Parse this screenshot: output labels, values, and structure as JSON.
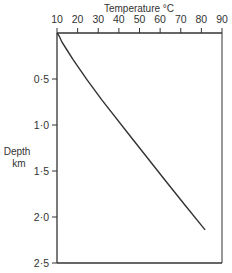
{
  "chart_data": {
    "type": "line",
    "title": "",
    "xlabel": "Temperature °C",
    "ylabel": "Depth km",
    "ylabel_lines": [
      "Depth",
      "km"
    ],
    "x_axis_position": "top",
    "y_axis_inverted": true,
    "xlim": [
      10,
      90
    ],
    "ylim": [
      0,
      2.5
    ],
    "x_ticks": [
      10,
      20,
      30,
      40,
      50,
      60,
      70,
      80,
      90
    ],
    "x_tick_labels": [
      "10",
      "20",
      "30",
      "40",
      "50",
      "60",
      "70",
      "80",
      "90"
    ],
    "y_ticks": [
      0.5,
      1.0,
      1.5,
      2.0,
      2.5
    ],
    "y_tick_labels": [
      "0·5",
      "1·0",
      "1·5",
      "2·0",
      "2·5"
    ],
    "grid": false,
    "legend": null,
    "series": [
      {
        "name": "Temperature vs depth",
        "points": [
          {
            "x": 10.0,
            "y": 0.0
          },
          {
            "x": 11.0,
            "y": 0.03
          },
          {
            "x": 12.4,
            "y": 0.1
          },
          {
            "x": 15.0,
            "y": 0.19
          },
          {
            "x": 17.8,
            "y": 0.29
          },
          {
            "x": 24.6,
            "y": 0.51
          },
          {
            "x": 31.8,
            "y": 0.73
          },
          {
            "x": 46.9,
            "y": 1.16
          },
          {
            "x": 62.4,
            "y": 1.6
          },
          {
            "x": 72.0,
            "y": 1.87
          },
          {
            "x": 81.8,
            "y": 2.14
          }
        ]
      }
    ]
  },
  "colors": {
    "axis": "#333333",
    "line": "#333333",
    "background": "#ffffff"
  }
}
